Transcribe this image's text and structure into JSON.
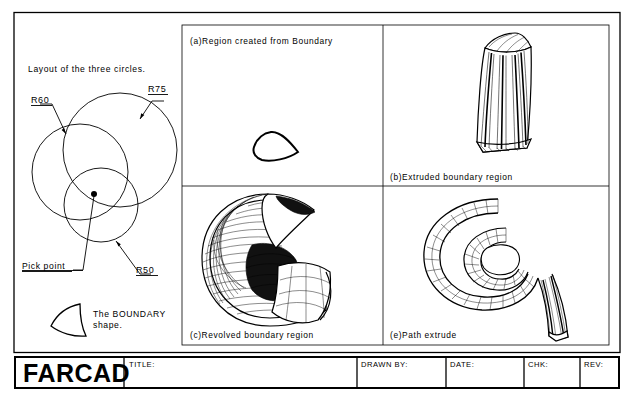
{
  "sheet": {
    "title": "FARCAD drawing sheet",
    "background_color": "#ffffff",
    "line_color": "#000000"
  },
  "left_panel": {
    "heading": "Layout of the three circles.",
    "dimension_labels": [
      {
        "name": "r60",
        "text": "R60"
      },
      {
        "name": "r75",
        "text": "R75"
      },
      {
        "name": "r50",
        "text": "R50"
      }
    ],
    "pick_point_label": "Pick point",
    "boundary_note_line1": "The BOUNDARY",
    "boundary_note_line2": "shape."
  },
  "panels": [
    {
      "id": "a",
      "caption": "(a)Region created from Boundary",
      "figure": "flat-region-shape"
    },
    {
      "id": "b",
      "caption": "(b)Extruded boundary region",
      "figure": "extruded-prism"
    },
    {
      "id": "c",
      "caption": "(c)Revolved boundary region",
      "figure": "revolved-mesh-solid"
    },
    {
      "id": "e",
      "caption": "(e)Path extrude",
      "figure": "helical-swept-tube"
    }
  ],
  "title_block": {
    "logo": "FARCAD",
    "fields": [
      {
        "name": "title",
        "label": "TITLE:",
        "value": ""
      },
      {
        "name": "drawn-by",
        "label": "DRAWN BY:",
        "value": ""
      },
      {
        "name": "date",
        "label": "DATE:",
        "value": ""
      },
      {
        "name": "chk",
        "label": "CHK:",
        "value": ""
      },
      {
        "name": "rev",
        "label": "REV:",
        "value": ""
      }
    ]
  }
}
